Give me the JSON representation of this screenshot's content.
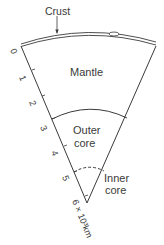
{
  "diagram": {
    "labels": {
      "crust": "Crust",
      "mantle": "Mantle",
      "outer_core_1": "Outer",
      "outer_core_2": "core",
      "inner_core_1": "Inner",
      "inner_core_2": "core"
    },
    "scale": {
      "ticks": [
        "0",
        "1",
        "2",
        "3",
        "4",
        "5"
      ],
      "end_label": "6 × 10³km"
    },
    "colors": {
      "ink": "#3a3a3a",
      "background": "#ffffff"
    }
  }
}
